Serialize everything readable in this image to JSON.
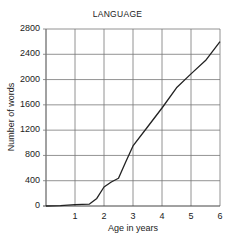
{
  "chart_data": {
    "type": "line",
    "title": "LANGUAGE",
    "xlabel": "Age in years",
    "ylabel": "Number of words",
    "x_ticks": [
      "1",
      "2",
      "3",
      "4",
      "5",
      "6"
    ],
    "y_ticks": [
      "0",
      "400",
      "800",
      "1200",
      "1600",
      "2000",
      "2400",
      "2800"
    ],
    "xlim": [
      0,
      6
    ],
    "ylim": [
      0,
      2800
    ],
    "grid": true,
    "legend": "none",
    "series": [
      {
        "name": "Number of words",
        "x": [
          0,
          0.5,
          1,
          1.5,
          1.75,
          2,
          2.25,
          2.5,
          2.75,
          3,
          3.5,
          4,
          4.5,
          5,
          5.5,
          6
        ],
        "values": [
          0,
          5,
          20,
          30,
          120,
          300,
          380,
          440,
          700,
          950,
          1250,
          1550,
          1870,
          2090,
          2300,
          2600
        ]
      }
    ]
  }
}
